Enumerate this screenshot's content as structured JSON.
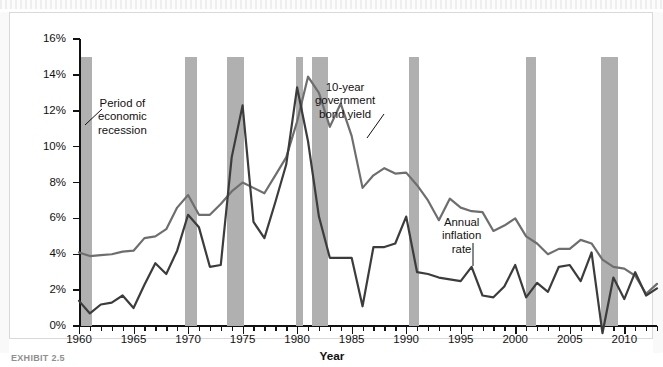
{
  "figure": {
    "caption": "EXHIBIT 2.5",
    "frame_border_color": "#d9d9d9"
  },
  "annotations": {
    "recession": {
      "line1": "Period of",
      "line2": "economic",
      "line3": "recession"
    },
    "bond": {
      "line1": "10-year",
      "line2": "government",
      "line3": "bond yield"
    },
    "inflation": {
      "line1": "Annual",
      "line2": "inflation",
      "line3": "rate"
    }
  },
  "colors": {
    "bond_line": "#6e6e6e",
    "inflation_line": "#3c3c3c",
    "recession_band": "#b0b0b0",
    "axis": "#111111"
  },
  "chart_data": {
    "type": "line",
    "title": "",
    "xlabel": "Year",
    "ylabel": "Inflation Rate or Interest Rate (Bond Yield)",
    "xlim": [
      1960,
      2013
    ],
    "ylim": [
      0,
      16
    ],
    "ytick_labels": [
      "0%",
      "2%",
      "4%",
      "6%",
      "8%",
      "10%",
      "12%",
      "14%",
      "16%"
    ],
    "ytick_values": [
      0,
      2,
      4,
      6,
      8,
      10,
      12,
      14,
      16
    ],
    "xtick_labels": [
      "1960",
      "1965",
      "1970",
      "1975",
      "1980",
      "1985",
      "1990",
      "1995",
      "2000",
      "2005",
      "2010"
    ],
    "xtick_values": [
      1960,
      1965,
      1970,
      1975,
      1980,
      1985,
      1990,
      1995,
      2000,
      2005,
      2010
    ],
    "xtick_minor_step": 1,
    "grid": false,
    "legend_position": "inline-annotations",
    "x": [
      1960,
      1961,
      1962,
      1963,
      1964,
      1965,
      1966,
      1967,
      1968,
      1969,
      1970,
      1971,
      1972,
      1973,
      1974,
      1975,
      1976,
      1977,
      1978,
      1979,
      1980,
      1981,
      1982,
      1983,
      1984,
      1985,
      1986,
      1987,
      1988,
      1989,
      1990,
      1991,
      1992,
      1993,
      1994,
      1995,
      1996,
      1997,
      1998,
      1999,
      2000,
      2001,
      2002,
      2003,
      2004,
      2005,
      2006,
      2007,
      2008,
      2009,
      2010,
      2011,
      2012,
      2013
    ],
    "series": [
      {
        "name": "10-year government bond yield",
        "color": "#6e6e6e",
        "values": [
          4.1,
          3.9,
          3.95,
          4.0,
          4.15,
          4.2,
          4.9,
          5.0,
          5.4,
          6.6,
          7.3,
          6.2,
          6.2,
          6.8,
          7.5,
          8.0,
          7.7,
          7.4,
          8.4,
          9.4,
          11.4,
          13.9,
          13.0,
          11.1,
          12.4,
          10.6,
          7.7,
          8.4,
          8.8,
          8.5,
          8.55,
          7.85,
          7.0,
          5.9,
          7.1,
          6.6,
          6.4,
          6.35,
          5.3,
          5.6,
          6.0,
          5.0,
          4.6,
          4.0,
          4.3,
          4.3,
          4.8,
          4.6,
          3.7,
          3.3,
          3.2,
          2.8,
          1.8,
          2.35
        ]
      },
      {
        "name": "Annual inflation rate",
        "color": "#3c3c3c",
        "values": [
          1.4,
          0.7,
          1.2,
          1.3,
          1.7,
          1.0,
          2.3,
          3.5,
          2.9,
          4.2,
          6.2,
          5.5,
          3.3,
          3.4,
          9.4,
          12.3,
          5.8,
          4.9,
          6.9,
          9.0,
          13.3,
          10.3,
          6.1,
          3.8,
          3.8,
          3.8,
          1.1,
          4.4,
          4.4,
          4.6,
          6.1,
          3.0,
          2.9,
          2.7,
          2.6,
          2.5,
          3.3,
          1.7,
          1.6,
          2.2,
          3.4,
          1.6,
          2.4,
          1.9,
          3.3,
          3.4,
          2.5,
          4.1,
          -0.4,
          2.7,
          1.5,
          3.0,
          1.7,
          2.1
        ]
      }
    ],
    "recession_bands": [
      {
        "start": 1960.2,
        "end": 1961.2
      },
      {
        "start": 1969.7,
        "end": 1970.8
      },
      {
        "start": 1973.6,
        "end": 1975.1
      },
      {
        "start": 1979.9,
        "end": 1980.5
      },
      {
        "start": 1981.4,
        "end": 1982.8
      },
      {
        "start": 1990.3,
        "end": 1991.2
      },
      {
        "start": 2001.0,
        "end": 2001.9
      },
      {
        "start": 2007.9,
        "end": 2009.4
      }
    ]
  }
}
